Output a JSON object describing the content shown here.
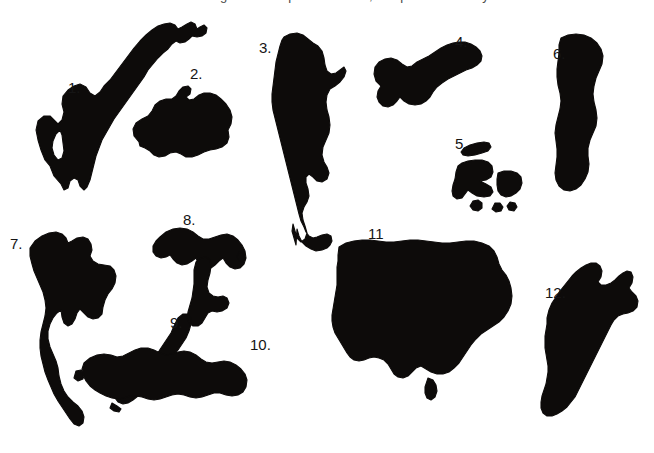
{
  "figure": {
    "caption_top": "Figure 1.  Map silhouettes, shapes to identify.",
    "background_color": "#ffffff",
    "silhouette_color": "#0d0b0a",
    "label_color": "#151515",
    "width": 654,
    "height": 453
  },
  "labels": [
    {
      "text": "1.",
      "x": 68,
      "y": 80
    },
    {
      "text": "2.",
      "x": 190,
      "y": 66
    },
    {
      "text": "3.",
      "x": 259,
      "y": 40
    },
    {
      "text": "4.",
      "x": 455,
      "y": 34
    },
    {
      "text": "5.",
      "x": 455,
      "y": 136
    },
    {
      "text": "6.",
      "x": 553,
      "y": 46
    },
    {
      "text": "7.",
      "x": 10,
      "y": 236
    },
    {
      "text": "8.",
      "x": 183,
      "y": 212
    },
    {
      "text": "9.",
      "x": 170,
      "y": 315
    },
    {
      "text": "10.",
      "x": 250,
      "y": 337
    },
    {
      "text": "11",
      "x": 368,
      "y": 226
    },
    {
      "text": "12.",
      "x": 545,
      "y": 285
    }
  ],
  "shapes": [
    {
      "id": 1,
      "name": "shape-1-scandinavia",
      "path": "M61,184 L54,176 L50,166 L45,160 L41,150 L38,140 L36,130 L38,121 L44,116 L50,116 L54,120 L58,124 L62,120 L64,112 L62,104 L63,96 L68,90 L74,86 L80,84 L86,87 L90,93 L95,96 L100,92 L104,86 L110,80 L116,72 L122,64 L128,56 L134,48 L140,41 L146,35 L152,30 L158,26 L164,24 L170,23 L175,25 L178,29 L182,27 L187,24 L191,22 L195,24 L197,29 L200,27 L204,25 L207,28 L206,33 L202,36 L197,37 L192,36 L189,39 L185,42 L180,43 L176,41 L172,44 L168,49 L163,53 L158,58 L153,64 L148,70 L144,77 L139,84 L134,91 L129,98 L124,105 L119,112 L114,119 L110,126 L106,133 L102,140 L99,148 L96,156 L94,164 L92,172 L90,180 L87,187 L84,190 L80,186 L78,180 L74,178 L70,181 L68,188 L64,190 L61,184 Z M60,130 L56,134 L53,141 L52,148 L54,155 L58,160 L62,158 L64,151 L63,143 L62,135 Z"
    },
    {
      "id": 2,
      "name": "shape-2-iceland",
      "path": "M139,142 L134,136 L133,129 L136,123 L142,119 L148,116 L152,111 L155,105 L160,101 L166,99 L172,99 L176,96 L179,91 L183,87 L188,86 L191,89 L190,94 L186,97 L189,100 L194,99 L199,95 L204,93 L210,93 L216,95 L221,99 L226,104 L230,110 L232,117 L231,124 L228,130 L229,137 L227,143 L222,147 L216,149 L210,150 L204,152 L198,155 L192,157 L186,157 L181,154 L176,152 L170,153 L165,156 L159,157 L154,155 L150,151 L145,148 L140,146 L139,142 Z"
    },
    {
      "id": 3,
      "name": "shape-3-south-america",
      "path": "M284,37 L290,34 L297,33 L303,35 L308,39 L313,43 L318,46 L322,51 L324,58 L325,65 L327,71 L331,74 L336,73 L340,70 L344,67 L346,71 L344,77 L340,82 L335,86 L330,89 L327,95 L326,102 L327,110 L329,117 L330,125 L329,133 L326,140 L323,147 L322,155 L324,162 L327,167 L329,173 L327,179 L322,182 L317,181 L313,177 L309,174 L306,177 L306,183 L308,189 L309,196 L307,202 L304,207 L302,213 L303,220 L305,226 L307,233 L305,239 L301,242 L297,238 L295,231 L293,224 L292,231 L294,238 L296,245 L297,229 L299,236 L302,242 L306,246 L311,249 L316,251 L322,250 L327,248 L330,245 L332,241 L331,236 L327,234 L322,235 L317,237 L313,238 L309,236 L306,232 L304,227 L301,221 L299,214 L297,206 L295,198 L293,190 L291,182 L289,174 L287,166 L285,158 L283,150 L281,142 L279,134 L277,126 L275,118 L273,110 L272,102 L272,94 L273,86 L274,78 L275,70 L276,62 L278,54 L280,46 L282,40 L284,37 Z"
    },
    {
      "id": 4,
      "name": "shape-4-indochina-peninsula",
      "path": "M381,86 L376,81 L374,74 L375,67 L379,62 L385,59 L391,58 L397,60 L402,64 L407,67 L412,66 L417,62 L423,59 L429,56 L435,52 L441,48 L447,45 L453,43 L459,42 L465,42 L471,44 L476,47 L480,51 L482,56 L481,61 L477,65 L472,68 L466,70 L460,73 L454,76 L448,79 L442,83 L437,87 L433,92 L430,97 L426,101 L421,104 L415,105 L409,104 L404,101 L400,97 L397,101 L393,105 L388,107 L383,106 L379,102 L377,97 L378,91 L381,86 Z"
    },
    {
      "id": 5,
      "name": "shape-5-japan-fragments",
      "path": "M464,148 L470,145 L477,143 L484,142 L489,143 L491,147 L488,151 L482,153 L475,155 L468,156 L463,155 L461,152 L464,148 Z M462,163 L468,161 L475,160 L482,160 L488,162 L492,166 L493,172 L491,177 L486,180 L480,181 L486,184 L491,187 L493,192 L490,196 L484,197 L477,196 L472,193 L468,190 L465,194 L462,198 L457,199 L453,196 L452,191 L453,185 L455,179 L456,172 L458,166 L462,163 Z M498,173 L504,171 L511,171 L517,173 L521,177 L522,183 L520,189 L516,193 L511,196 L506,197 L501,195 L498,191 L497,185 L497,179 L498,173 Z M473,201 L478,200 L482,203 L482,208 L478,211 L473,210 L470,206 L473,201 Z M495,203 L500,203 L503,207 L501,211 L496,212 L492,209 L495,203 Z M510,202 L515,203 L517,207 L514,211 L509,210 L507,206 L510,202 Z"
    },
    {
      "id": 6,
      "name": "shape-6-sweden",
      "path": "M561,38 L568,35 L576,34 L584,35 L591,38 L597,43 L601,49 L603,56 L602,64 L599,71 L596,78 L594,86 L593,94 L594,102 L596,110 L597,118 L596,126 L593,133 L590,140 L588,148 L588,156 L589,164 L588,172 L585,179 L581,185 L576,189 L570,191 L564,190 L559,186 L556,180 L555,173 L556,165 L557,157 L557,149 L556,141 L555,133 L556,125 L558,117 L560,109 L561,101 L560,93 L558,85 L557,77 L557,69 L558,61 L559,53 L559,45 L561,38 Z"
    },
    {
      "id": 7,
      "name": "shape-7-thailand",
      "path": "M30,248 L35,241 L42,236 L49,233 L56,232 L62,234 L66,238 L68,243 L72,241 L77,238 L83,237 L88,239 L91,244 L92,250 L90,256 L93,261 L98,264 L104,265 L110,266 L114,270 L116,276 L115,283 L112,289 L108,294 L105,300 L103,307 L102,314 L98,318 L93,319 L88,317 L84,313 L80,309 L77,313 L75,319 L72,324 L68,326 L64,323 L62,317 L61,310 L57,313 L53,318 L50,324 L48,331 L48,339 L50,347 L53,354 L56,361 L58,368 L59,376 L61,384 L64,391 L68,397 L73,402 L78,406 L82,411 L84,417 L83,423 L79,426 L74,424 L70,419 L66,413 L62,407 L58,401 L54,394 L51,387 L48,380 L45,372 L43,364 L41,356 L40,348 L40,340 L41,332 L43,324 L45,316 L46,308 L45,300 L43,292 L40,285 L37,278 L34,271 L32,264 L30,256 L30,248 Z"
    },
    {
      "id": 8,
      "name": "shape-8-peninsula-8",
      "path": "M160,237 L166,232 L173,229 L180,228 L187,229 L193,232 L198,236 L203,239 L209,239 L215,237 L221,235 L227,234 L233,236 L238,240 L242,245 L245,251 L246,258 L244,264 L240,268 L235,269 L230,267 L226,263 L223,258 L219,261 L215,265 L211,268 L206,269 L201,267 L198,263 L196,258 L192,261 L187,264 L182,265 L177,263 L173,259 L170,255 L166,257 L161,258 L156,256 L153,252 L153,246 L156,241 L160,237 Z M239,252 L243,254 L245,258 L243,262 L239,261 L237,257 L239,252 Z"
    },
    {
      "id": 9,
      "name": "shape-9-new-zealand",
      "path": "M196,262 L201,258 L206,257 L210,260 L211,266 L210,273 L208,280 L207,287 L209,293 L213,296 L218,297 L223,296 L227,298 L229,303 L227,308 L222,311 L217,312 L212,311 L208,313 L205,318 L202,323 L198,326 L193,326 L189,323 L187,318 L188,312 L190,305 L192,298 L193,291 L194,284 L194,277 L194,270 L196,262 Z M178,318 L183,314 L188,314 L191,318 L191,324 L189,331 L186,338 L182,344 L178,350 L173,356 L168,362 L163,368 L158,374 L153,380 L148,386 L143,391 L138,396 L133,400 L128,403 L123,404 L118,402 L115,398 L116,393 L120,389 L125,386 L130,382 L135,378 L140,373 L145,368 L150,363 L154,357 L159,351 L163,345 L167,339 L171,333 L174,326 L178,318 Z M112,403 L117,406 L121,409 L119,412 L114,411 L110,408 L112,403 Z"
    },
    {
      "id": 10,
      "name": "shape-10-turkey",
      "path": "M84,363 L90,358 L97,355 L104,354 L111,355 L117,357 L123,356 L129,353 L135,350 L141,348 L148,348 L154,350 L160,353 L166,355 L172,354 L178,352 L184,351 L190,352 L196,355 L201,359 L206,362 L212,363 L218,362 L224,361 L230,362 L236,365 L241,369 L245,374 L247,380 L246,387 L243,392 L238,395 L232,396 L226,395 L220,393 L214,393 L208,395 L202,397 L196,398 L190,397 L184,395 L178,394 L172,395 L166,397 L160,399 L154,400 L148,399 L142,397 L136,396 L130,396 L124,398 L118,399 L112,398 L106,396 L100,393 L95,390 L90,386 L86,381 L83,375 L82,369 L84,363 Z M76,371 L81,370 L84,374 L83,379 L78,381 L74,378 L76,371 Z"
    },
    {
      "id": 11,
      "name": "shape-11-united-states",
      "path": "M339,247 L346,243 L354,241 L362,240 L370,240 L378,241 L386,242 L394,242 L402,241 L410,240 L418,240 L426,241 L434,242 L442,243 L450,243 L458,242 L466,241 L474,241 L482,243 L489,246 L494,251 L497,257 L499,264 L502,270 L506,275 L509,281 L511,288 L512,296 L511,304 L508,311 L504,317 L499,322 L493,326 L487,330 L481,334 L476,339 L471,345 L467,351 L463,357 L459,363 L454,368 L449,372 L443,374 L437,374 L431,372 L426,369 L421,366 L416,368 L412,372 L408,376 L403,378 L398,377 L394,374 L391,369 L388,364 L384,360 L379,358 L374,357 L369,358 L364,360 L359,361 L354,360 L350,357 L347,353 L344,348 L341,343 L338,338 L335,333 L333,327 L332,321 L332,315 L333,309 L334,303 L335,297 L336,291 L337,285 L337,279 L337,273 L337,267 L338,261 L338,255 L339,247 Z M428,378 L433,380 L436,385 L437,391 L435,397 L431,400 L427,398 L425,393 L425,387 L428,378 Z"
    },
    {
      "id": 12,
      "name": "shape-12-greenland",
      "path": "M547,318 L549,310 L552,303 L556,297 L560,291 L564,286 L568,281 L572,276 L576,272 L581,268 L586,265 L591,263 L596,263 L600,266 L602,271 L601,277 L598,282 L601,285 L606,285 L611,283 L615,280 L619,276 L623,273 L627,271 L631,272 L633,277 L632,283 L629,288 L632,292 L636,296 L638,301 L637,307 L633,311 L628,313 L623,314 L618,316 L614,320 L611,325 L608,331 L605,337 L602,343 L599,349 L596,355 L593,361 L590,367 L587,373 L584,379 L581,385 L578,391 L575,397 L571,402 L567,407 L562,411 L557,414 L552,416 L547,416 L543,413 L541,408 L541,402 L542,396 L544,390 L546,384 L547,378 L548,372 L548,366 L547,360 L546,354 L545,348 L545,342 L545,336 L546,330 L547,324 L547,318 Z"
    }
  ]
}
